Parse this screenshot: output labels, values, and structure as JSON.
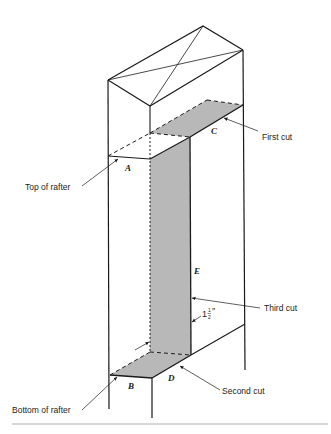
{
  "figure": {
    "colors": {
      "line": "#1a1a1a",
      "shade": "#b8b8b8",
      "rule": "#999999"
    },
    "point_labels": {
      "a": "A",
      "b": "B",
      "c": "C",
      "d": "D",
      "e": "E"
    },
    "callouts": {
      "first_cut": "First cut",
      "second_cut": "Second cut",
      "third_cut": "Third cut",
      "top_of_rafter": "Top of rafter",
      "bottom_of_rafter": "Bottom of rafter"
    },
    "dimension": {
      "whole": "1",
      "numerator": "1",
      "denominator": "2",
      "unit": "″"
    }
  }
}
